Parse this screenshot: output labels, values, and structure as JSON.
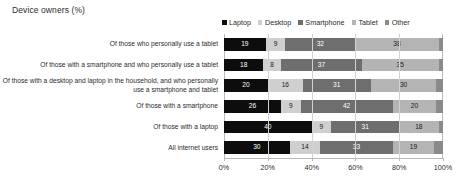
{
  "chart_data": {
    "type": "bar",
    "orientation": "horizontal",
    "stacked": true,
    "normalized_percent": true,
    "title": "Device owners (%)",
    "xlabel": "",
    "ylabel": "",
    "xlim": [
      0,
      100
    ],
    "xticks": [
      "0%",
      "20%",
      "40%",
      "60%",
      "80%",
      "100%"
    ],
    "xtick_values": [
      0,
      20,
      40,
      60,
      80,
      100
    ],
    "grid": true,
    "legend_position": "top-right",
    "categories": [
      "Of those who personally use a tablet",
      "Of those with a smartphone and who personally use a tablet",
      "Of those with a desktop and laptop in the household, and who personally use a smartphone and tablet",
      "Of those with a smartphone",
      "Of those with a laptop",
      "All internet users"
    ],
    "series": [
      {
        "name": "Laptop",
        "color": "#0d0d0d",
        "values": [
          19,
          18,
          20,
          26,
          40,
          30
        ]
      },
      {
        "name": "Desktop",
        "color": "#cfcfcf",
        "values": [
          9,
          8,
          16,
          9,
          9,
          14
        ]
      },
      {
        "name": "Smartphone",
        "color": "#6e6e6e",
        "values": [
          32,
          37,
          31,
          42,
          31,
          33
        ]
      },
      {
        "name": "Tablet",
        "color": "#b4b4b4",
        "values": [
          38,
          35,
          30,
          20,
          18,
          19
        ]
      },
      {
        "name": "Other",
        "color": "#8a8a8a",
        "values": [
          2,
          2,
          3,
          3,
          2,
          4
        ]
      }
    ],
    "value_labels": {
      "show_for": [
        "Laptop",
        "Desktop",
        "Smartphone",
        "Tablet"
      ],
      "hide_for": [
        "Other"
      ]
    }
  },
  "legend": {
    "items": [
      {
        "label": "Laptop",
        "swatch_color": "#0d0d0d"
      },
      {
        "label": "Desktop",
        "swatch_color": "#cfcfcf"
      },
      {
        "label": "Smartphone",
        "swatch_color": "#6e6e6e"
      },
      {
        "label": "Tablet",
        "swatch_color": "#b4b4b4"
      },
      {
        "label": "Other",
        "swatch_color": "#8a8a8a"
      }
    ]
  }
}
